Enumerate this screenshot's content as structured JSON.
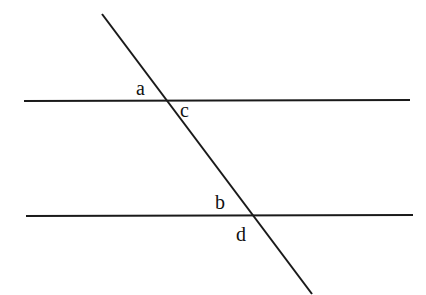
{
  "diagram": {
    "type": "parallel-lines-transversal",
    "lines": [
      {
        "name": "top-parallel-line",
        "x1": 24,
        "y1": 101,
        "x2": 410,
        "y2": 100
      },
      {
        "name": "bottom-parallel-line",
        "x1": 26,
        "y1": 216,
        "x2": 413,
        "y2": 215
      },
      {
        "name": "transversal-line",
        "x1": 102,
        "y1": 14,
        "x2": 312,
        "y2": 294
      }
    ],
    "stroke_color": "#1a1a1a",
    "labels": {
      "a": "a",
      "b": "b",
      "c": "c",
      "d": "d"
    }
  }
}
